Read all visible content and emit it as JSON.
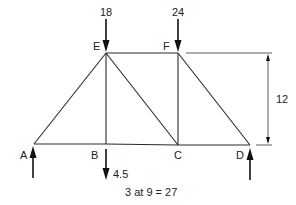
{
  "diagram": {
    "type": "truss",
    "nodes": [
      {
        "id": "A",
        "label": "A",
        "x": 34,
        "y": 144
      },
      {
        "id": "B",
        "label": "B",
        "x": 106,
        "y": 144
      },
      {
        "id": "C",
        "label": "C",
        "x": 178,
        "y": 145
      },
      {
        "id": "D",
        "label": "D",
        "x": 250,
        "y": 145
      },
      {
        "id": "E",
        "label": "E",
        "x": 106,
        "y": 53
      },
      {
        "id": "F",
        "label": "F",
        "x": 178,
        "y": 53
      }
    ],
    "members": [
      [
        "A",
        "B"
      ],
      [
        "B",
        "C"
      ],
      [
        "C",
        "D"
      ],
      [
        "E",
        "F"
      ],
      [
        "A",
        "E"
      ],
      [
        "B",
        "E"
      ],
      [
        "E",
        "C"
      ],
      [
        "C",
        "F"
      ],
      [
        "F",
        "D"
      ]
    ],
    "loads": [
      {
        "node": "E",
        "value": "18",
        "direction": "down"
      },
      {
        "node": "F",
        "value": "24",
        "direction": "down"
      },
      {
        "node": "B",
        "value": "4.5",
        "direction": "down"
      }
    ],
    "reactions": [
      {
        "node": "A",
        "direction": "up"
      },
      {
        "node": "D",
        "direction": "up"
      }
    ],
    "dimensions": {
      "height": "12",
      "span": "3 at 9 = 27"
    }
  }
}
